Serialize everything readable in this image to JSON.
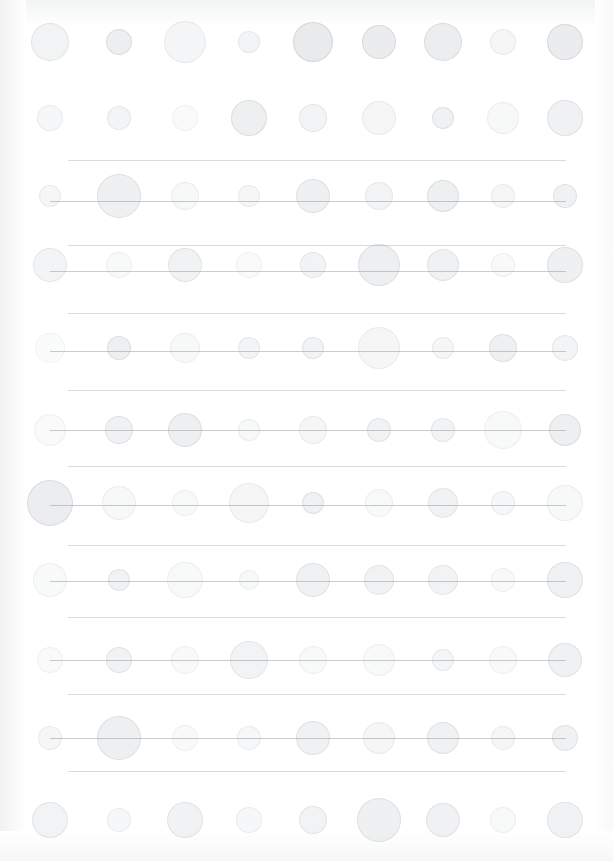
{
  "palette": {
    "background": "#ffffff",
    "dot_fill": "#e3e6e8",
    "dot_stroke": "#dfe2e4",
    "rule": "#d8dadc",
    "connector": "#c9ccce",
    "page_wash": "#f4f5f6"
  },
  "chart_data": {
    "type": "scatter",
    "title": "",
    "subtitle": "",
    "xlabel": "",
    "ylabel": "",
    "grid": true,
    "legend": null,
    "legend_position": "none",
    "xlim": [
      0,
      613
    ],
    "ylim": [
      0,
      861
    ],
    "columns": [
      {
        "name": "c1",
        "x": 50
      },
      {
        "name": "c2",
        "x": 119
      },
      {
        "name": "c3",
        "x": 185
      },
      {
        "name": "c4",
        "x": 249
      },
      {
        "name": "c5",
        "x": 313
      },
      {
        "name": "c6",
        "x": 379
      },
      {
        "name": "c7",
        "x": 443
      },
      {
        "name": "c8",
        "x": 503
      },
      {
        "name": "c9",
        "x": 565
      }
    ],
    "rules": [
      {
        "y": 160,
        "x1": 68,
        "x2": 566
      },
      {
        "y": 201,
        "x1": 68,
        "x2": 566
      },
      {
        "y": 245,
        "x1": 68,
        "x2": 566
      },
      {
        "y": 313,
        "x1": 68,
        "x2": 566
      },
      {
        "y": 390,
        "x1": 68,
        "x2": 566
      },
      {
        "y": 466,
        "x1": 68,
        "x2": 566
      },
      {
        "y": 545,
        "x1": 68,
        "x2": 566
      },
      {
        "y": 617,
        "x1": 68,
        "x2": 566
      },
      {
        "y": 694,
        "x1": 68,
        "x2": 566
      },
      {
        "y": 771,
        "x1": 68,
        "x2": 566
      }
    ],
    "connectors": [
      {
        "y": 201,
        "x1": 50,
        "x2": 566
      },
      {
        "y": 271,
        "x1": 50,
        "x2": 566
      },
      {
        "y": 351,
        "x1": 50,
        "x2": 566
      },
      {
        "y": 430,
        "x1": 50,
        "x2": 566
      },
      {
        "y": 505,
        "x1": 50,
        "x2": 566
      },
      {
        "y": 581,
        "x1": 50,
        "x2": 566
      },
      {
        "y": 660,
        "x1": 50,
        "x2": 566
      },
      {
        "y": 738,
        "x1": 50,
        "x2": 566
      }
    ],
    "series": [
      {
        "name": "row-1",
        "y": 42,
        "values": [
          {
            "x": 50,
            "r": 19,
            "v": 0.3
          },
          {
            "x": 119,
            "r": 13,
            "v": 0.42
          },
          {
            "x": 185,
            "r": 21,
            "v": 0.24
          },
          {
            "x": 249,
            "r": 11,
            "v": 0.26
          },
          {
            "x": 313,
            "r": 20,
            "v": 0.5
          },
          {
            "x": 379,
            "r": 17,
            "v": 0.46
          },
          {
            "x": 443,
            "r": 19,
            "v": 0.44
          },
          {
            "x": 503,
            "r": 13,
            "v": 0.22
          },
          {
            "x": 565,
            "r": 18,
            "v": 0.46
          }
        ]
      },
      {
        "name": "row-2",
        "y": 118,
        "values": [
          {
            "x": 50,
            "r": 13,
            "v": 0.2
          },
          {
            "x": 119,
            "r": 12,
            "v": 0.26
          },
          {
            "x": 185,
            "r": 13,
            "v": 0.12
          },
          {
            "x": 249,
            "r": 18,
            "v": 0.4
          },
          {
            "x": 313,
            "r": 14,
            "v": 0.28
          },
          {
            "x": 379,
            "r": 17,
            "v": 0.22
          },
          {
            "x": 443,
            "r": 11,
            "v": 0.34
          },
          {
            "x": 503,
            "r": 16,
            "v": 0.18
          },
          {
            "x": 565,
            "r": 18,
            "v": 0.34
          }
        ]
      },
      {
        "name": "row-3",
        "y": 196,
        "values": [
          {
            "x": 50,
            "r": 11,
            "v": 0.22
          },
          {
            "x": 119,
            "r": 22,
            "v": 0.36
          },
          {
            "x": 185,
            "r": 14,
            "v": 0.18
          },
          {
            "x": 249,
            "r": 11,
            "v": 0.22
          },
          {
            "x": 313,
            "r": 17,
            "v": 0.36
          },
          {
            "x": 379,
            "r": 14,
            "v": 0.26
          },
          {
            "x": 443,
            "r": 16,
            "v": 0.4
          },
          {
            "x": 503,
            "r": 12,
            "v": 0.22
          },
          {
            "x": 565,
            "r": 12,
            "v": 0.34
          }
        ]
      },
      {
        "name": "row-4",
        "y": 265,
        "values": [
          {
            "x": 50,
            "r": 17,
            "v": 0.28
          },
          {
            "x": 119,
            "r": 13,
            "v": 0.16
          },
          {
            "x": 185,
            "r": 17,
            "v": 0.32
          },
          {
            "x": 249,
            "r": 13,
            "v": 0.12
          },
          {
            "x": 313,
            "r": 13,
            "v": 0.3
          },
          {
            "x": 379,
            "r": 21,
            "v": 0.38
          },
          {
            "x": 443,
            "r": 16,
            "v": 0.34
          },
          {
            "x": 503,
            "r": 12,
            "v": 0.14
          },
          {
            "x": 565,
            "r": 18,
            "v": 0.36
          }
        ]
      },
      {
        "name": "row-5",
        "y": 348,
        "values": [
          {
            "x": 50,
            "r": 15,
            "v": 0.1
          },
          {
            "x": 119,
            "r": 12,
            "v": 0.38
          },
          {
            "x": 185,
            "r": 15,
            "v": 0.18
          },
          {
            "x": 249,
            "r": 11,
            "v": 0.26
          },
          {
            "x": 313,
            "r": 11,
            "v": 0.3
          },
          {
            "x": 379,
            "r": 21,
            "v": 0.22
          },
          {
            "x": 443,
            "r": 11,
            "v": 0.22
          },
          {
            "x": 503,
            "r": 14,
            "v": 0.36
          },
          {
            "x": 565,
            "r": 13,
            "v": 0.28
          }
        ]
      },
      {
        "name": "row-6",
        "y": 430,
        "values": [
          {
            "x": 50,
            "r": 16,
            "v": 0.12
          },
          {
            "x": 119,
            "r": 14,
            "v": 0.34
          },
          {
            "x": 185,
            "r": 17,
            "v": 0.38
          },
          {
            "x": 249,
            "r": 11,
            "v": 0.18
          },
          {
            "x": 313,
            "r": 14,
            "v": 0.22
          },
          {
            "x": 379,
            "r": 12,
            "v": 0.32
          },
          {
            "x": 443,
            "r": 12,
            "v": 0.3
          },
          {
            "x": 503,
            "r": 19,
            "v": 0.16
          },
          {
            "x": 565,
            "r": 16,
            "v": 0.4
          }
        ]
      },
      {
        "name": "row-7",
        "y": 503,
        "values": [
          {
            "x": 50,
            "r": 23,
            "v": 0.44
          },
          {
            "x": 119,
            "r": 17,
            "v": 0.18
          },
          {
            "x": 185,
            "r": 13,
            "v": 0.16
          },
          {
            "x": 249,
            "r": 20,
            "v": 0.22
          },
          {
            "x": 313,
            "r": 11,
            "v": 0.34
          },
          {
            "x": 379,
            "r": 14,
            "v": 0.16
          },
          {
            "x": 443,
            "r": 15,
            "v": 0.32
          },
          {
            "x": 503,
            "r": 12,
            "v": 0.2
          },
          {
            "x": 565,
            "r": 18,
            "v": 0.18
          }
        ]
      },
      {
        "name": "row-8",
        "y": 580,
        "values": [
          {
            "x": 50,
            "r": 17,
            "v": 0.16
          },
          {
            "x": 119,
            "r": 11,
            "v": 0.32
          },
          {
            "x": 185,
            "r": 18,
            "v": 0.16
          },
          {
            "x": 249,
            "r": 10,
            "v": 0.18
          },
          {
            "x": 313,
            "r": 17,
            "v": 0.34
          },
          {
            "x": 379,
            "r": 15,
            "v": 0.32
          },
          {
            "x": 443,
            "r": 15,
            "v": 0.3
          },
          {
            "x": 503,
            "r": 12,
            "v": 0.14
          },
          {
            "x": 565,
            "r": 18,
            "v": 0.34
          }
        ]
      },
      {
        "name": "row-9",
        "y": 660,
        "values": [
          {
            "x": 50,
            "r": 13,
            "v": 0.12
          },
          {
            "x": 119,
            "r": 13,
            "v": 0.32
          },
          {
            "x": 185,
            "r": 14,
            "v": 0.14
          },
          {
            "x": 249,
            "r": 19,
            "v": 0.3
          },
          {
            "x": 313,
            "r": 14,
            "v": 0.16
          },
          {
            "x": 379,
            "r": 16,
            "v": 0.16
          },
          {
            "x": 443,
            "r": 11,
            "v": 0.24
          },
          {
            "x": 503,
            "r": 14,
            "v": 0.14
          },
          {
            "x": 565,
            "r": 17,
            "v": 0.34
          }
        ]
      },
      {
        "name": "row-10",
        "y": 738,
        "values": [
          {
            "x": 50,
            "r": 12,
            "v": 0.22
          },
          {
            "x": 119,
            "r": 22,
            "v": 0.38
          },
          {
            "x": 185,
            "r": 13,
            "v": 0.14
          },
          {
            "x": 249,
            "r": 12,
            "v": 0.2
          },
          {
            "x": 313,
            "r": 17,
            "v": 0.34
          },
          {
            "x": 379,
            "r": 16,
            "v": 0.22
          },
          {
            "x": 443,
            "r": 16,
            "v": 0.34
          },
          {
            "x": 503,
            "r": 12,
            "v": 0.22
          },
          {
            "x": 565,
            "r": 13,
            "v": 0.34
          }
        ]
      },
      {
        "name": "row-11",
        "y": 820,
        "values": [
          {
            "x": 50,
            "r": 18,
            "v": 0.3
          },
          {
            "x": 119,
            "r": 12,
            "v": 0.2
          },
          {
            "x": 185,
            "r": 18,
            "v": 0.32
          },
          {
            "x": 249,
            "r": 13,
            "v": 0.2
          },
          {
            "x": 313,
            "r": 14,
            "v": 0.3
          },
          {
            "x": 379,
            "r": 22,
            "v": 0.36
          },
          {
            "x": 443,
            "r": 17,
            "v": 0.34
          },
          {
            "x": 503,
            "r": 13,
            "v": 0.16
          },
          {
            "x": 565,
            "r": 18,
            "v": 0.32
          }
        ]
      }
    ]
  }
}
